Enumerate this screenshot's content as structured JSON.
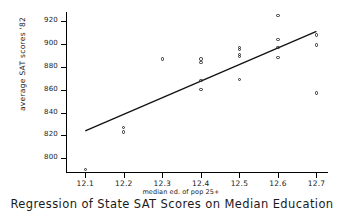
{
  "chart_data": {
    "type": "scatter",
    "title": "Regression of State SAT Scores on Median Education",
    "xlabel": "median ed. of pop 25+",
    "ylabel": "average SAT scores '82",
    "xlim": [
      12.05,
      12.73
    ],
    "ylim": [
      788,
      928
    ],
    "grid": false,
    "legend": null,
    "xticks": [
      "12.1",
      "12.2",
      "12.3",
      "12.4",
      "12.5",
      "12.6",
      "12.7"
    ],
    "xtick_values": [
      12.1,
      12.2,
      12.3,
      12.4,
      12.5,
      12.6,
      12.7
    ],
    "yticks": [
      "800",
      "820",
      "840",
      "860",
      "880",
      "900",
      "920"
    ],
    "ytick_values": [
      800,
      820,
      840,
      860,
      880,
      900,
      920
    ],
    "points": [
      {
        "x": 12.1,
        "y": 790
      },
      {
        "x": 12.2,
        "y": 827
      },
      {
        "x": 12.2,
        "y": 823
      },
      {
        "x": 12.3,
        "y": 887
      },
      {
        "x": 12.4,
        "y": 887
      },
      {
        "x": 12.4,
        "y": 884
      },
      {
        "x": 12.4,
        "y": 868
      },
      {
        "x": 12.4,
        "y": 860
      },
      {
        "x": 12.5,
        "y": 897
      },
      {
        "x": 12.5,
        "y": 895
      },
      {
        "x": 12.5,
        "y": 891
      },
      {
        "x": 12.5,
        "y": 889
      },
      {
        "x": 12.5,
        "y": 869
      },
      {
        "x": 12.6,
        "y": 925
      },
      {
        "x": 12.6,
        "y": 904
      },
      {
        "x": 12.6,
        "y": 897
      },
      {
        "x": 12.6,
        "y": 888
      },
      {
        "x": 12.7,
        "y": 908
      },
      {
        "x": 12.7,
        "y": 899
      },
      {
        "x": 12.7,
        "y": 857
      }
    ],
    "fit_line": {
      "type": "line",
      "x_start": 12.1,
      "y_start": 824,
      "x_end": 12.7,
      "y_end": 911
    }
  }
}
